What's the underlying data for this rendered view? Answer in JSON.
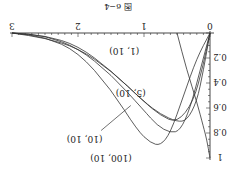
{
  "figure": {
    "caption": "图 6−4",
    "rotation_deg": 180
  },
  "chart_data": {
    "type": "line",
    "title": "",
    "caption": "图 6−4",
    "xlabel": "",
    "ylabel": "",
    "xlim": [
      0,
      3
    ],
    "ylim": [
      0,
      1
    ],
    "x_ticks": [
      "0",
      "1",
      "2",
      "3"
    ],
    "y_ticks": [
      "0.2",
      "0.4",
      "0.6",
      "0.8",
      "1"
    ],
    "grid": false,
    "legend": "inline labels",
    "orientation_note": "figure displayed rotated 180 degrees",
    "series": [
      {
        "name": "(1, 10)",
        "x": [
          0,
          0.1,
          0.25,
          0.5,
          0.75,
          1.0,
          1.5,
          2.0,
          2.5,
          3.0
        ],
        "y": [
          0,
          0.25,
          0.55,
          0.72,
          0.66,
          0.55,
          0.3,
          0.12,
          0.04,
          0.0
        ]
      },
      {
        "name": "(5, 10)",
        "x": [
          0,
          0.1,
          0.2,
          0.35,
          0.5,
          0.75,
          1.0,
          1.5,
          2.0,
          2.5,
          3.0
        ],
        "y": [
          0,
          0.3,
          0.55,
          0.7,
          0.71,
          0.65,
          0.55,
          0.3,
          0.1,
          0.02,
          0.0
        ]
      },
      {
        "name": "(10, 10)",
        "x": [
          0,
          0.15,
          0.3,
          0.45,
          0.6,
          0.8,
          1.0,
          1.5,
          2.0,
          2.5,
          3.0
        ],
        "y": [
          0,
          0.3,
          0.6,
          0.78,
          0.8,
          0.74,
          0.62,
          0.33,
          0.12,
          0.02,
          0.0
        ]
      },
      {
        "name": "(100, 10)",
        "x": [
          0,
          0.2,
          0.4,
          0.6,
          0.75,
          0.9,
          1.1,
          1.5,
          2.0,
          2.5,
          3.0
        ],
        "y": [
          0,
          0.2,
          0.5,
          0.8,
          0.9,
          0.88,
          0.78,
          0.45,
          0.15,
          0.03,
          0.0
        ]
      },
      {
        "name": "unlabeled",
        "x": [
          0,
          0.05,
          0.1,
          0.2,
          0.35,
          0.5
        ],
        "y": [
          1.0,
          0.85,
          0.75,
          0.55,
          0.3,
          0.0
        ]
      }
    ],
    "annotations": [
      {
        "text": "(1, 10)",
        "x": 1.3,
        "y": 0.14
      },
      {
        "text": "(5, 10)",
        "x": 1.2,
        "y": 0.48
      },
      {
        "text": "(10, 10)",
        "x": 1.9,
        "y": 0.85
      },
      {
        "text": "(100, 10)",
        "x": 1.5,
        "y": 1.0
      }
    ]
  }
}
